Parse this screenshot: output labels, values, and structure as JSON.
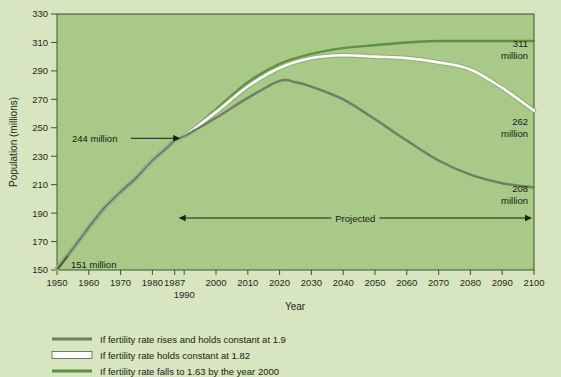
{
  "chart_data": {
    "type": "line",
    "title": "",
    "xlabel": "Year",
    "ylabel": "Population (millions)",
    "xlim": [
      1950,
      2100
    ],
    "ylim": [
      150,
      330
    ],
    "grid": false,
    "legend_position": "below",
    "x_ticks": [
      "1950",
      "1960",
      "1970",
      "1980",
      "1987",
      "2000",
      "2010",
      "2020",
      "2030",
      "2040",
      "2050",
      "2060",
      "2070",
      "2080",
      "2090",
      "2100"
    ],
    "x_tick_values": [
      1950,
      1960,
      1970,
      1980,
      1987,
      2000,
      2010,
      2020,
      2030,
      2040,
      2050,
      2060,
      2070,
      2080,
      2090,
      2100
    ],
    "x_tick_extra": {
      "label": "1990",
      "value": 1990
    },
    "y_ticks": [
      150,
      170,
      190,
      210,
      230,
      250,
      270,
      290,
      310,
      330
    ],
    "series": [
      {
        "name": "If fertility rate rises and holds constant at 1.9",
        "color": "#6f7f63",
        "style": "solid-gray",
        "end_label": "208\nmillion",
        "end_value": 208,
        "x": [
          1950,
          1955,
          1960,
          1965,
          1970,
          1975,
          1980,
          1985,
          1987,
          1990,
          2000,
          2010,
          2020,
          2025,
          2030,
          2040,
          2050,
          2060,
          2070,
          2080,
          2090,
          2100
        ],
        "values": [
          151,
          165,
          180,
          194,
          205,
          215,
          227,
          237,
          241,
          244,
          257,
          271,
          283,
          282,
          279,
          270,
          256,
          241,
          227,
          217,
          211,
          208
        ]
      },
      {
        "name": "If fertility rate holds constant at 1.82",
        "color": "#ffffff",
        "style": "white-outline",
        "end_label": "262\nmillion",
        "end_value": 262,
        "x": [
          1950,
          1955,
          1960,
          1965,
          1970,
          1975,
          1980,
          1985,
          1987,
          1990,
          2000,
          2010,
          2020,
          2030,
          2040,
          2050,
          2060,
          2070,
          2080,
          2090,
          2100
        ],
        "values": [
          151,
          165,
          180,
          194,
          205,
          215,
          227,
          237,
          241,
          244,
          261,
          279,
          292,
          299,
          301,
          300,
          299,
          296,
          291,
          278,
          262
        ]
      },
      {
        "name": "If fertility rate falls to 1.63 by the year 2000",
        "color": "#5f9141",
        "style": "solid-green",
        "end_label": "311\nmillion",
        "end_value": 311,
        "x": [
          1950,
          1955,
          1960,
          1965,
          1970,
          1975,
          1980,
          1985,
          1987,
          1990,
          2000,
          2010,
          2020,
          2030,
          2040,
          2050,
          2060,
          2070,
          2080,
          2090,
          2100
        ],
        "values": [
          151,
          165,
          180,
          194,
          205,
          215,
          227,
          237,
          241,
          244,
          263,
          282,
          295,
          302,
          306,
          308,
          310,
          311,
          311,
          311,
          311
        ]
      }
    ],
    "annotations": [
      {
        "name": "start-value",
        "text": "151 million",
        "x": 1950,
        "y": 150,
        "kind": "leader"
      },
      {
        "name": "divergence-value",
        "text": "244 million",
        "x": 1990,
        "y": 244,
        "kind": "arrow"
      },
      {
        "name": "projected-span",
        "text": "Projected",
        "x_from": 1987,
        "x_to": 2100,
        "y": 178,
        "kind": "double-arrow"
      }
    ]
  },
  "legend": {
    "items": [
      {
        "label": "If fertility rate rises and holds constant at 1.9",
        "swatch": "gray-line-swatch",
        "color": "#6f7f63"
      },
      {
        "label": "If fertility rate holds constant at 1.82",
        "swatch": "white-box-swatch",
        "color": "#ffffff"
      },
      {
        "label": "If fertility rate falls to 1.63 by the year 2000",
        "swatch": "green-line-swatch",
        "color": "#5f9141"
      }
    ]
  },
  "labels": {
    "end_311": "311",
    "end_311_unit": "million",
    "end_262": "262",
    "end_262_unit": "million",
    "end_208": "208",
    "end_208_unit": "million",
    "start_151": "151 million",
    "diverge_244": "244 million",
    "projected": "Projected",
    "x_axis_title": "Year",
    "y_axis_title": "Population (millions)",
    "extra_x_tick": "1990"
  },
  "colors": {
    "page_background": "#d7e5c0",
    "plot_background": "#a8c987",
    "frame": "#3f5530",
    "text": "#17220f",
    "series_gray": "#6f7f63",
    "series_white": "#ffffff",
    "series_green": "#5f9141"
  }
}
